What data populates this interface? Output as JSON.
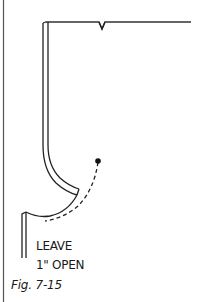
{
  "figure": {
    "annotation": {
      "line1": "LEAVE",
      "line2": "1\" OPEN"
    },
    "caption": "Fig. 7-15",
    "stroke_color": "#222222",
    "background": "#ffffff"
  }
}
